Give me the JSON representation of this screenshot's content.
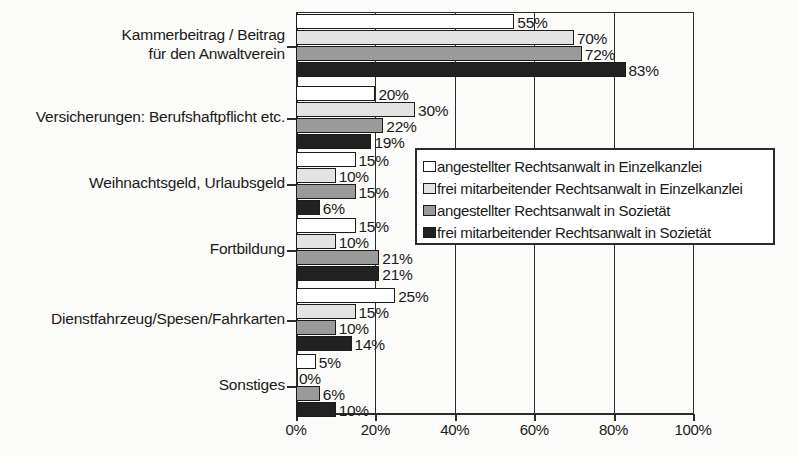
{
  "chart_data": {
    "type": "bar",
    "orientation": "horizontal",
    "title": "",
    "xlabel": "",
    "ylabel": "",
    "xlim": [
      0,
      100
    ],
    "xticks": [
      "0%",
      "20%",
      "40%",
      "60%",
      "80%",
      "100%"
    ],
    "xtick_values": [
      0,
      20,
      40,
      60,
      80,
      100
    ],
    "grid": true,
    "legend_position": "center-right-overlay",
    "value_suffix": "%",
    "categories": [
      "Kammerbeitrag / Beitrag\nfür den Anwaltverein",
      "Versicherungen: Berufshaftpflicht etc.",
      "Weihnachtsgeld, Urlaubsgeld",
      "Fortbildung",
      "Dienstfahrzeug/Spesen/Fahrkarten",
      "Sonstiges"
    ],
    "category_lines": [
      [
        "Kammerbeitrag / Beitrag",
        "für den Anwaltverein"
      ],
      [
        "Versicherungen: Berufshaftpflicht etc."
      ],
      [
        "Weihnachtsgeld, Urlaubsgeld"
      ],
      [
        "Fortbildung"
      ],
      [
        "Dienstfahrzeug/Spesen/Fahrkarten"
      ],
      [
        "Sonstiges"
      ]
    ],
    "series": [
      {
        "name": "angestellter Rechtsanwalt in Einzelkanzlei",
        "color": "#ffffff",
        "values": [
          55,
          20,
          15,
          15,
          25,
          5
        ],
        "labels": [
          "55%",
          "20%",
          "15%",
          "15%",
          "25%",
          "5%"
        ]
      },
      {
        "name": "frei mitarbeitender Rechtsanwalt in Einzelkanzlei",
        "color": "#e3e3e3",
        "values": [
          70,
          30,
          10,
          10,
          15,
          0
        ],
        "labels": [
          "70%",
          "30%",
          "10%",
          "10%",
          "15%",
          "0%"
        ]
      },
      {
        "name": "angestellter Rechtsanwalt in Sozietät",
        "color": "#9a9a9a",
        "values": [
          72,
          22,
          15,
          21,
          10,
          6
        ],
        "labels": [
          "72%",
          "22%",
          "15%",
          "21%",
          "10%",
          "6%"
        ]
      },
      {
        "name": "frei mitarbeitender Rechtsanwalt in Sozietät",
        "color": "#212121",
        "values": [
          83,
          19,
          6,
          21,
          14,
          10
        ],
        "labels": [
          "83%",
          "19%",
          "6%",
          "21%",
          "14%",
          "10%"
        ]
      }
    ]
  },
  "legend": {
    "items": [
      {
        "label": "angestellter Rechtsanwalt in Einzelkanzlei",
        "color": "#ffffff"
      },
      {
        "label": "frei mitarbeitender Rechtsanwalt in Einzelkanzlei",
        "color": "#e3e3e3"
      },
      {
        "label": "angestellter Rechtsanwalt in Sozietät",
        "color": "#9a9a9a"
      },
      {
        "label": "frei mitarbeitender Rechtsanwalt in Sozietät",
        "color": "#212121"
      }
    ]
  }
}
